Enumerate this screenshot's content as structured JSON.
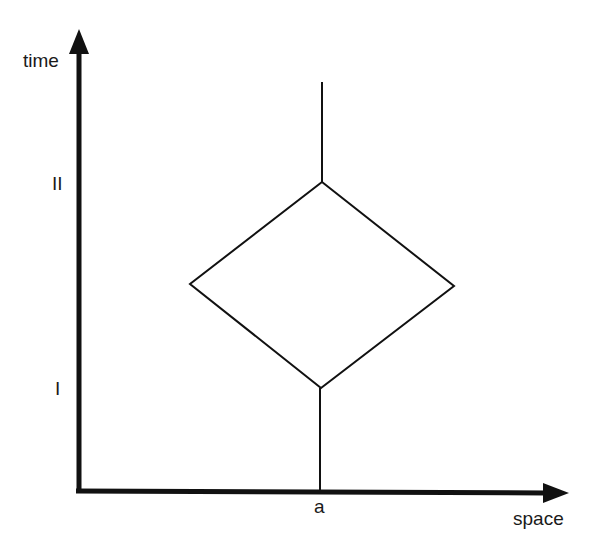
{
  "diagram": {
    "type": "spacetime-diagram",
    "axes": {
      "y_label": "time",
      "x_label": "space",
      "y_ticks": [
        {
          "label": "II",
          "y": 183
        },
        {
          "label": "I",
          "y": 388
        }
      ],
      "x_ticks": [
        {
          "label": "a",
          "x": 320
        }
      ]
    },
    "shapes": {
      "upper_line": {
        "x": 322,
        "y1": 82,
        "y2": 182
      },
      "diamond": {
        "top": [
          322,
          182
        ],
        "right": [
          454,
          286
        ],
        "bottom": [
          321,
          388
        ],
        "left": [
          190,
          284
        ]
      },
      "lower_line": {
        "x": 320,
        "y1": 388,
        "y2": 491
      }
    },
    "colors": {
      "stroke": "#111111",
      "background": "#ffffff"
    }
  }
}
